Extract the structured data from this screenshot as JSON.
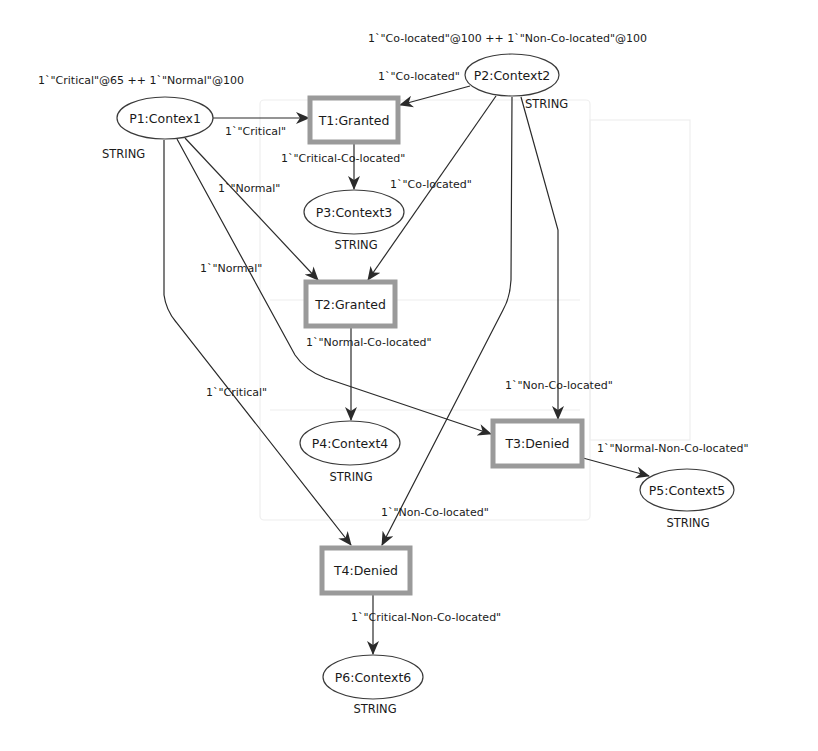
{
  "places": [
    {
      "id": "P1",
      "label": "P1:Contex1",
      "type": "STRING",
      "marking": "1`\"Critical\"@65 ++ 1`\"Normal\"@100"
    },
    {
      "id": "P2",
      "label": "P2:Context2",
      "type": "STRING",
      "marking": "1`\"Co-located\"@100 ++ 1`\"Non-Co-located\"@100"
    },
    {
      "id": "P3",
      "label": "P3:Context3",
      "type": "STRING"
    },
    {
      "id": "P4",
      "label": "P4:Context4",
      "type": "STRING"
    },
    {
      "id": "P5",
      "label": "P5:Context5",
      "type": "STRING"
    },
    {
      "id": "P6",
      "label": "P6:Context6",
      "type": "STRING"
    }
  ],
  "transitions": [
    {
      "id": "T1",
      "label": "T1:Granted"
    },
    {
      "id": "T2",
      "label": "T2:Granted"
    },
    {
      "id": "T3",
      "label": "T3:Denied"
    },
    {
      "id": "T4",
      "label": "T4:Denied"
    }
  ],
  "arcs": [
    {
      "from": "P1",
      "to": "T1",
      "label": "1`\"Critical\""
    },
    {
      "from": "P2",
      "to": "T1",
      "label": "1`\"Co-located\""
    },
    {
      "from": "T1",
      "to": "P3",
      "label": "1`\"Critical-Co-located\""
    },
    {
      "from": "P1",
      "to": "T2",
      "label": "1`\"Normal\""
    },
    {
      "from": "P2",
      "to": "T2",
      "label": "1`\"Co-located\""
    },
    {
      "from": "T2",
      "to": "P4",
      "label": "1`\"Normal-Co-located\""
    },
    {
      "from": "P1",
      "to": "T3",
      "label": "1`\"Normal\""
    },
    {
      "from": "P2",
      "to": "T3",
      "label": "1`\"Non-Co-located\""
    },
    {
      "from": "T3",
      "to": "P5",
      "label": "1`\"Normal-Non-Co-located\""
    },
    {
      "from": "P1",
      "to": "T4",
      "label": "1`\"Critical\""
    },
    {
      "from": "P2",
      "to": "T4",
      "label": "1`\"Non-Co-located\""
    },
    {
      "from": "T4",
      "to": "P6",
      "label": "1`\"Critical-Non-Co-located\""
    }
  ],
  "colors": {
    "line": "#2a2a2a",
    "transition_border": "#9a9a9a",
    "place_border": "#3a3a3a"
  }
}
